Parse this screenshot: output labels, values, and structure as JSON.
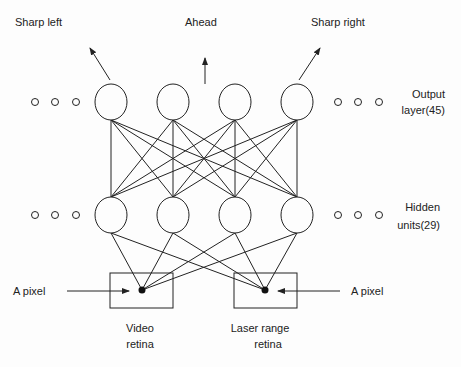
{
  "labels": {
    "sharp_left": "Sharp left",
    "ahead": "Ahead",
    "sharp_right": "Sharp right",
    "output_layer_1": "Output",
    "output_layer_2": "layer(45)",
    "hidden_units_1": "Hidden",
    "hidden_units_2": "units(29)",
    "pixel_left": "A pixel",
    "pixel_right": "A pixel",
    "video_retina_1": "Video",
    "video_retina_2": "retina",
    "laser_retina_1": "Laser range",
    "laser_retina_2": "retina"
  },
  "network": {
    "output_layer_size": 45,
    "hidden_units": 29,
    "output_nodes_x": [
      111,
      173,
      235,
      297
    ],
    "output_nodes_y": 102,
    "hidden_nodes_x": [
      111,
      173,
      235,
      297
    ],
    "hidden_nodes_y": 215,
    "inputs": [
      {
        "name": "Video retina",
        "pixel": [
          142,
          290
        ]
      },
      {
        "name": "Laser range retina",
        "pixel": [
          265,
          290
        ]
      }
    ]
  },
  "colors": {
    "stroke": "#222222",
    "background": "#fdfdfd"
  }
}
